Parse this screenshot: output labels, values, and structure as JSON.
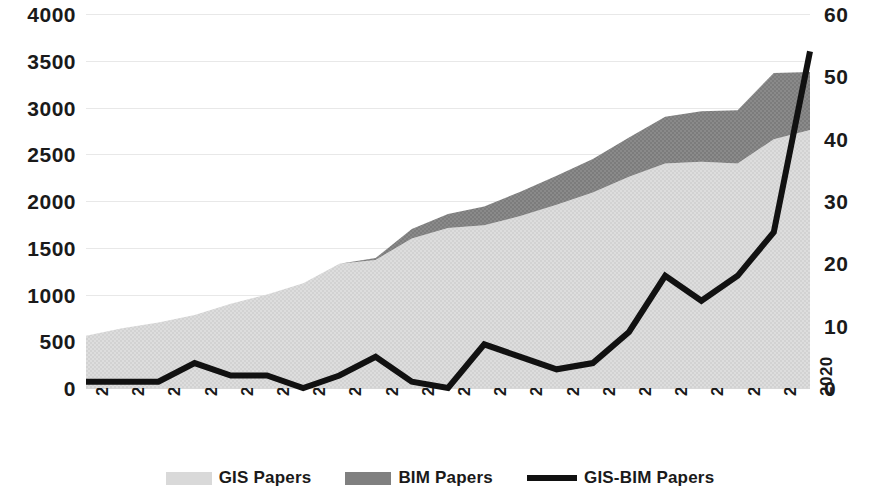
{
  "chart_data": {
    "type": "area",
    "title": "",
    "subtitle": "",
    "xlabel": "",
    "ylabel": "",
    "y2label": "",
    "grid": true,
    "legend_position": "bottom",
    "stacked": true,
    "categories": [
      "2000",
      "2001",
      "2002",
      "2003",
      "2004",
      "2005",
      "2006",
      "2007",
      "2008",
      "2009",
      "2010",
      "2011",
      "2012",
      "2013",
      "2014",
      "2015",
      "2016",
      "2017",
      "2018",
      "2019",
      "2020"
    ],
    "ylim": [
      0,
      4000
    ],
    "yticks": [
      0,
      500,
      1000,
      1500,
      2000,
      2500,
      3000,
      3500,
      4000
    ],
    "y2lim": [
      0,
      60
    ],
    "y2ticks": [
      0,
      10,
      20,
      30,
      40,
      50,
      60
    ],
    "series": [
      {
        "name": "GIS Papers",
        "type": "area",
        "axis": "left",
        "color": "#d9d9d9",
        "values": [
          560,
          640,
          700,
          780,
          900,
          1000,
          1120,
          1330,
          1370,
          1600,
          1710,
          1740,
          1840,
          1960,
          2090,
          2260,
          2400,
          2420,
          2400,
          2660,
          2760
        ]
      },
      {
        "name": "BIM Papers",
        "type": "area",
        "axis": "left",
        "color": "#808080",
        "values": [
          0,
          0,
          0,
          0,
          0,
          0,
          0,
          0,
          20,
          100,
          150,
          200,
          260,
          310,
          360,
          420,
          500,
          540,
          570,
          710,
          620
        ]
      },
      {
        "name": "GIS-BIM Papers",
        "type": "line",
        "axis": "right",
        "color": "#111111",
        "values": [
          1,
          1,
          1,
          4,
          2,
          2,
          0,
          2,
          5,
          1,
          0,
          7,
          5,
          3,
          4,
          9,
          18,
          14,
          18,
          25,
          54
        ]
      }
    ]
  },
  "legend": {
    "items": [
      {
        "label": "GIS Papers",
        "marker": "area-swatch",
        "color": "#d9d9d9"
      },
      {
        "label": "BIM Papers",
        "marker": "area-swatch",
        "color": "#808080"
      },
      {
        "label": "GIS-BIM Papers",
        "marker": "line-swatch",
        "color": "#111111"
      }
    ]
  }
}
